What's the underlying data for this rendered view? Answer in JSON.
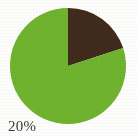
{
  "background_color": "#fdfdfb",
  "label": {
    "text": "20%",
    "color": "#3a3a38"
  },
  "chart_data": {
    "type": "pie",
    "title": "",
    "subtitle": "",
    "xlabel": "",
    "ylabel": "",
    "legend": "none",
    "grid": false,
    "start_angle_deg": 0,
    "direction": "clockwise",
    "center": {
      "cx": 68,
      "cy": 66
    },
    "radius": 58,
    "categories": [
      "Dark brown slice",
      "Green slice"
    ],
    "values": [
      20,
      80
    ],
    "value_unit": "%",
    "colors": [
      "#402b1d",
      "#6fb32e"
    ],
    "annotations": [
      {
        "text": "20%",
        "refers_to": "Dark brown slice",
        "position": "bottom-left"
      }
    ],
    "slices": [
      {
        "name": "Dark brown slice",
        "value": 20,
        "label": "20%",
        "color": "#402b1d",
        "start_angle_deg": 0,
        "end_angle_deg": 72
      },
      {
        "name": "Green slice",
        "value": 80,
        "label": "",
        "color": "#6fb32e",
        "start_angle_deg": 72,
        "end_angle_deg": 360
      }
    ]
  }
}
